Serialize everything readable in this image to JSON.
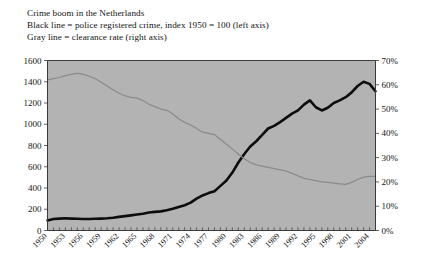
{
  "figure": {
    "caption_lines": [
      "Crime boom in the Netherlands",
      "Black line = police registered crime, index 1950 = 100 (left axis)",
      "Gray line = clearance rate (right axis)"
    ],
    "background_color": "#ffffff",
    "plot_background_color": "#b3b3b3",
    "black_line_color": "#0d0d0d",
    "gray_line_color": "#8a8a8a",
    "axis_color": "#3a3a3a"
  },
  "chart_data": {
    "type": "line",
    "title": "Crime boom in the Netherlands",
    "subtitle": "Black line = police registered crime, index 1950 = 100 (left axis); Gray line = clearance rate (right axis)",
    "xlabel": "",
    "ylabel": "",
    "grid": false,
    "legend_position": "none",
    "x": [
      1950,
      1951,
      1952,
      1953,
      1954,
      1955,
      1956,
      1957,
      1958,
      1959,
      1960,
      1961,
      1962,
      1963,
      1964,
      1965,
      1966,
      1967,
      1968,
      1969,
      1970,
      1971,
      1972,
      1973,
      1974,
      1975,
      1976,
      1977,
      1978,
      1979,
      1980,
      1981,
      1982,
      1983,
      1984,
      1985,
      1986,
      1987,
      1988,
      1989,
      1990,
      1991,
      1992,
      1993,
      1994,
      1995,
      1996,
      1997,
      1998,
      1999,
      2000,
      2001,
      2002,
      2003,
      2004,
      2005
    ],
    "xtick_labels": [
      "1950",
      "1953",
      "1956",
      "1959",
      "1962",
      "1965",
      "1968",
      "1971",
      "1974",
      "1977",
      "1980",
      "1983",
      "1986",
      "1989",
      "1992",
      "1995",
      "1998",
      "2001",
      "2004"
    ],
    "xtick_values": [
      1950,
      1953,
      1956,
      1959,
      1962,
      1965,
      1968,
      1971,
      1974,
      1977,
      1980,
      1983,
      1986,
      1989,
      1992,
      1995,
      1998,
      2001,
      2004
    ],
    "xlim": [
      1950,
      2005
    ],
    "left_axis": {
      "label": "",
      "ylim": [
        0,
        1600
      ],
      "ticks": [
        0,
        200,
        400,
        600,
        800,
        1000,
        1200,
        1400,
        1600
      ],
      "tick_labels": [
        "0",
        "200",
        "400",
        "600",
        "800",
        "1000",
        "1200",
        "1400",
        "1600"
      ]
    },
    "right_axis": {
      "label": "",
      "ylim": [
        0,
        70
      ],
      "ticks": [
        0,
        10,
        20,
        30,
        40,
        50,
        60,
        70
      ],
      "tick_labels": [
        "0%",
        "10%",
        "20%",
        "30%",
        "40%",
        "50%",
        "60%",
        "70%"
      ]
    },
    "series": [
      {
        "name": "police registered crime, index 1950 = 100",
        "axis": "left",
        "color": "#0d0d0d",
        "line_width": 2.6,
        "values": [
          95,
          108,
          112,
          115,
          112,
          110,
          108,
          108,
          110,
          112,
          115,
          120,
          128,
          135,
          142,
          150,
          158,
          170,
          175,
          180,
          190,
          205,
          222,
          238,
          262,
          300,
          330,
          352,
          370,
          420,
          470,
          545,
          640,
          720,
          790,
          840,
          900,
          960,
          985,
          1020,
          1060,
          1100,
          1130,
          1185,
          1225,
          1160,
          1130,
          1155,
          1200,
          1225,
          1255,
          1300,
          1360,
          1400,
          1380,
          1310
        ]
      },
      {
        "name": "clearance rate",
        "axis": "right",
        "color": "#8a8a8a",
        "line_width": 1.2,
        "values": [
          62.0,
          62.5,
          63.0,
          63.8,
          64.3,
          64.8,
          64.3,
          63.5,
          62.5,
          61.0,
          59.5,
          58.0,
          56.5,
          55.5,
          54.8,
          54.5,
          53.5,
          52.0,
          51.0,
          50.0,
          49.5,
          48.0,
          46.0,
          44.5,
          43.5,
          42.0,
          40.5,
          40.0,
          39.5,
          37.5,
          35.5,
          33.5,
          31.5,
          29.5,
          28.0,
          27.0,
          26.5,
          26.0,
          25.5,
          25.0,
          24.5,
          23.5,
          22.5,
          21.5,
          21.0,
          20.5,
          20.0,
          19.8,
          19.5,
          19.2,
          19.0,
          19.8,
          21.0,
          22.0,
          22.3,
          22.3
        ]
      }
    ]
  }
}
